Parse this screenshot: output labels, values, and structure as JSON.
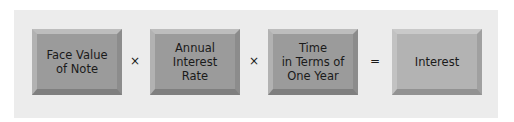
{
  "formula": {
    "terms": [
      {
        "label": "Face Value\nof Note"
      },
      {
        "label": "Annual\nInterest\nRate"
      },
      {
        "label": "Time\nin Terms of\nOne Year"
      },
      {
        "label": "Interest"
      }
    ],
    "operators": [
      "×",
      "×",
      "="
    ]
  },
  "colors": {
    "background": "#ececec",
    "term_box": "#9b9b9b",
    "result_box": "#b3b3b3"
  }
}
